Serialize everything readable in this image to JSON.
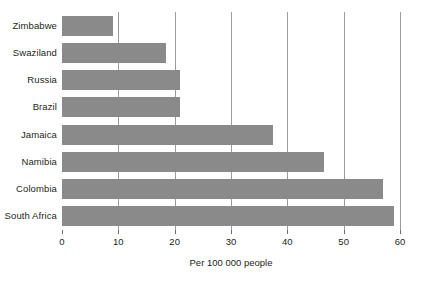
{
  "chart_data": {
    "type": "bar",
    "orientation": "horizontal",
    "title": "",
    "subtitle": "",
    "xlabel": "Per 100 000 people",
    "ylabel": "",
    "categories": [
      "Zimbabwe",
      "Swaziland",
      "Russia",
      "Brazil",
      "Jamaica",
      "Namibia",
      "Colombia",
      "South Africa"
    ],
    "values": [
      9,
      18.5,
      21,
      21,
      37.5,
      46.5,
      57,
      59
    ],
    "xlim": [
      0,
      60
    ],
    "xticks": [
      0,
      10,
      20,
      30,
      40,
      50,
      60
    ],
    "xtick_labels": [
      "0",
      "10",
      "20",
      "30",
      "40",
      "50",
      "60"
    ],
    "grid": "vertical",
    "legend": "none",
    "bar_color": "#8a8a8a",
    "gridline_color": "#9b9b9b",
    "background": "#ffffff"
  }
}
